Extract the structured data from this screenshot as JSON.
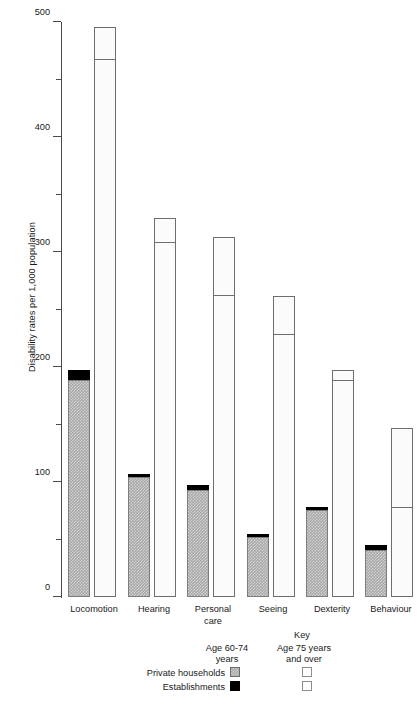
{
  "chart_data": {
    "type": "bar",
    "title": "",
    "xlabel": "",
    "ylabel": "Disability rates per 1,000 population",
    "ylim": [
      0,
      500
    ],
    "ytick_labels": [
      "0",
      "100",
      "200",
      "300",
      "400",
      "500"
    ],
    "ytick_values": [
      0,
      100,
      200,
      300,
      400,
      500
    ],
    "yminor_values": [
      50,
      150,
      250,
      350,
      450
    ],
    "grid": false,
    "legend_position": "bottom",
    "categories": [
      "Locomotion",
      "Hearing",
      "Personal\ncare",
      "Seeing",
      "Dexterity",
      "Behaviour"
    ],
    "series": [
      {
        "name": "Age 60-74 years",
        "stack": true,
        "segments": [
          {
            "name": "Private households",
            "values": [
              189,
              104,
              93,
              52,
              76,
              41
            ]
          },
          {
            "name": "Establishments",
            "values": [
              8,
              3,
              4,
              3,
              2,
              4
            ]
          }
        ],
        "totals": [
          197,
          107,
          97,
          55,
          78,
          45
        ]
      },
      {
        "name": "Age 75 years and over",
        "stack": true,
        "segments": [
          {
            "name": "Private households",
            "values": [
              467,
              308,
              262,
              228,
              188,
              77
            ]
          },
          {
            "name": "Establishments",
            "values": [
              29,
              22,
              51,
              34,
              9,
              70
            ]
          }
        ],
        "totals": [
          496,
          330,
          313,
          262,
          197,
          147
        ]
      }
    ]
  },
  "key": {
    "title": "Key",
    "column_headers": [
      "Age 60-74\nyears",
      "Age 75 years\nand over"
    ],
    "row_labels": [
      "Private households",
      "Establishments"
    ]
  },
  "colors": {
    "households_young": "#a8a8a8",
    "establishments_young": "#000000",
    "households_old": "#fbfbfb",
    "establishments_old": "#ffffff",
    "axis": "#4a4a4a",
    "bar_outline": "#6e6e6e"
  }
}
